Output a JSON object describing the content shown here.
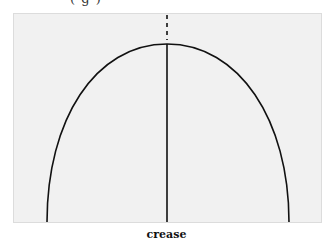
{
  "header": {
    "partial_text": "(  g      )"
  },
  "diagram": {
    "caption": "crease",
    "colors": {
      "panel": "#f1f1f1",
      "line": "#111111"
    },
    "arch": {
      "left_base_x": 47,
      "right_base_x": 289,
      "apex_x": 167,
      "apex_y": 44,
      "base_y": 222
    },
    "crease_line": {
      "x": 167,
      "dashed_from_y": 15,
      "dashed_to_y": 40,
      "solid_to_y": 222
    }
  }
}
